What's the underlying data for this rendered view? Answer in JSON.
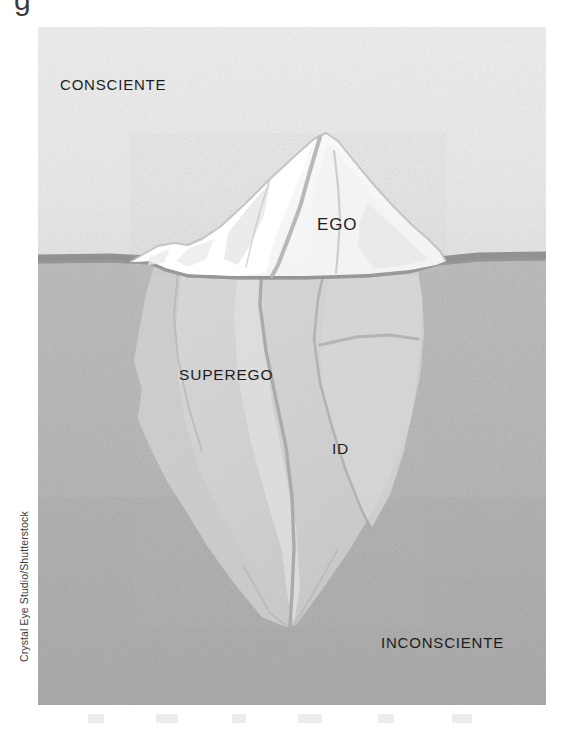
{
  "figure": {
    "alt_title": "Freudian iceberg model of the psyche",
    "clipped_glyph_above": "g",
    "credit": "Crystal Eye Studio/Shutterstock",
    "labels": {
      "conscious": "CONSCIENTE",
      "unconscious": "INCONSCIENTE",
      "ego": "EGO",
      "superego": "SUPEREGO",
      "id": "ID"
    },
    "colors": {
      "sky": "#ececec",
      "water": "#b3b3b3",
      "water_deep": "#a8a8a8",
      "waterline": "#8e8e8e",
      "ice_above": "#ffffff",
      "ice_above_shade": "#e6e6e6",
      "ice_below": "#d2d2d2",
      "ice_below_shade": "#c4c4c4",
      "crack": "#a9a9a9",
      "label_text": "#1d1d1d",
      "page_background": "#ffffff"
    },
    "layout": {
      "panel_x": 38,
      "panel_y": 27,
      "panel_width": 508,
      "panel_height": 678,
      "waterline_y": 231
    }
  }
}
